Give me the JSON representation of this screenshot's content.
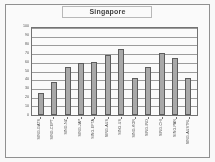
{
  "chart_data": {
    "type": "bar",
    "title": "Singapore",
    "xlabel": "",
    "ylabel": "",
    "ylim": [
      0,
      100
    ],
    "yticks": [
      100,
      90,
      80,
      70,
      60,
      50,
      40,
      30,
      20,
      10,
      0
    ],
    "grid": true,
    "legend": "none",
    "categories": [
      "SING-GATS",
      "SING-CEPT",
      "SING-NZ",
      "SING-JAP",
      "SING-EFTA",
      "SING-AUS",
      "SING-US",
      "SING-KOR",
      "SING-IND",
      "SING-CHI",
      "SING-PAN",
      "SING-AUSTRL"
    ],
    "values": [
      25,
      38,
      55,
      60,
      61,
      69,
      76,
      42,
      55,
      71,
      66,
      42
    ],
    "series": [
      {
        "name": "Singapore",
        "values": [
          25,
          38,
          55,
          60,
          61,
          69,
          76,
          42,
          55,
          71,
          66,
          42
        ]
      }
    ],
    "bar_color": "#a8a8a8",
    "bar_border_color": "#575757",
    "gridline_color": "#9a9a9a",
    "plot_border_color": "#6f6f6f"
  }
}
